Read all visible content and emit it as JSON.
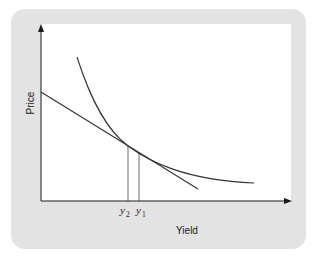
{
  "diagram": {
    "panel_color": "#e3e3e3",
    "plot_color": "#ffffff",
    "line_color": "#333333",
    "y_axis_label": "Price",
    "x_axis_label": "Yield",
    "x_ticks": [
      {
        "base": "y",
        "sub": "2"
      },
      {
        "base": "y",
        "sub": "1"
      }
    ],
    "elements": [
      {
        "type": "curve",
        "description": "convex price-yield curve"
      },
      {
        "type": "line",
        "description": "straight tangent line (duration approximation)"
      },
      {
        "type": "guide",
        "description": "vertical line at y2"
      },
      {
        "type": "guide",
        "description": "vertical line at y1"
      }
    ]
  }
}
